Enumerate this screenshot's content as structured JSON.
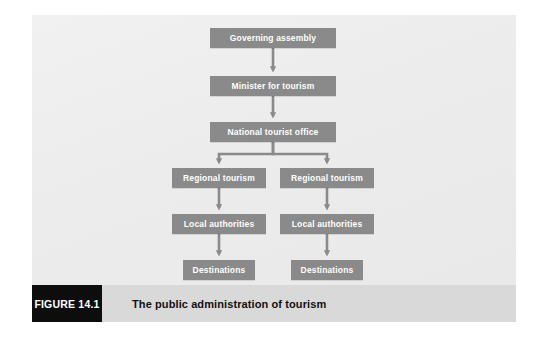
{
  "figure": {
    "badge_label": "FIGURE 14.1",
    "caption": "The public administration of tourism",
    "badge_bg": "#0d0d0d",
    "caption_bar_bg": "#d9d9d9",
    "panel_bg": "#ececec"
  },
  "diagram": {
    "node_fill": "#8a8a8a",
    "node_text_color": "#ffffff",
    "arrow_color": "#8a8a8a",
    "nodes": [
      {
        "id": "governing-assembly",
        "label": "Governing assembly",
        "x": 210,
        "y": 28,
        "w": 126,
        "h": 20
      },
      {
        "id": "minister-for-tourism",
        "label": "Minister for tourism",
        "x": 210,
        "y": 76,
        "w": 126,
        "h": 20
      },
      {
        "id": "national-tourist-office",
        "label": "National tourist office",
        "x": 210,
        "y": 122,
        "w": 126,
        "h": 20
      },
      {
        "id": "regional-tourism-left",
        "label": "Regional tourism",
        "x": 172,
        "y": 168,
        "w": 94,
        "h": 20
      },
      {
        "id": "regional-tourism-right",
        "label": "Regional tourism",
        "x": 280,
        "y": 168,
        "w": 94,
        "h": 20
      },
      {
        "id": "local-authorities-left",
        "label": "Local authorities",
        "x": 172,
        "y": 214,
        "w": 94,
        "h": 20
      },
      {
        "id": "local-authorities-right",
        "label": "Local authorities",
        "x": 280,
        "y": 214,
        "w": 94,
        "h": 20
      },
      {
        "id": "destinations-left",
        "label": "Destinations",
        "x": 183,
        "y": 260,
        "w": 72,
        "h": 20
      },
      {
        "id": "destinations-right",
        "label": "Destinations",
        "x": 291,
        "y": 260,
        "w": 72,
        "h": 20
      }
    ],
    "edges": [
      {
        "from": "governing-assembly",
        "to": "minister-for-tourism"
      },
      {
        "from": "minister-for-tourism",
        "to": "national-tourist-office"
      },
      {
        "from": "national-tourist-office",
        "to": "regional-tourism-left"
      },
      {
        "from": "national-tourist-office",
        "to": "regional-tourism-right"
      },
      {
        "from": "regional-tourism-left",
        "to": "local-authorities-left"
      },
      {
        "from": "regional-tourism-right",
        "to": "local-authorities-right"
      },
      {
        "from": "local-authorities-left",
        "to": "destinations-left"
      },
      {
        "from": "local-authorities-right",
        "to": "destinations-right"
      }
    ]
  }
}
